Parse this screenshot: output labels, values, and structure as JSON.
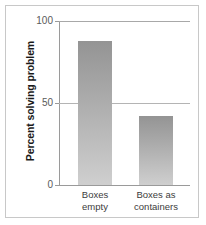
{
  "chart_data": {
    "type": "bar",
    "title": "",
    "subtitle": "",
    "xlabel": "",
    "ylabel": "Percent solving problem",
    "categories": [
      "Boxes empty",
      "Boxes as containers"
    ],
    "category_lines": [
      [
        "Boxes",
        "empty"
      ],
      [
        "Boxes as",
        "containers"
      ]
    ],
    "values": [
      88,
      42
    ],
    "ylim": [
      0,
      100
    ],
    "yticks": [
      0,
      50,
      100
    ],
    "ytick_labels": [
      "0",
      "50",
      "100"
    ],
    "grid": true,
    "gridlines_at": [
      50,
      100
    ],
    "legend": null,
    "legend_position": "none",
    "bar_fill_top_color": "#949494",
    "bar_fill_bottom_color": "#cfcfcf",
    "axis_color": "#9a9a9a",
    "frame_color": "#c8c8c8",
    "background_color": "#ffffff"
  },
  "axis": {
    "tick_100": "100",
    "tick_50": "50",
    "tick_0": "0"
  }
}
